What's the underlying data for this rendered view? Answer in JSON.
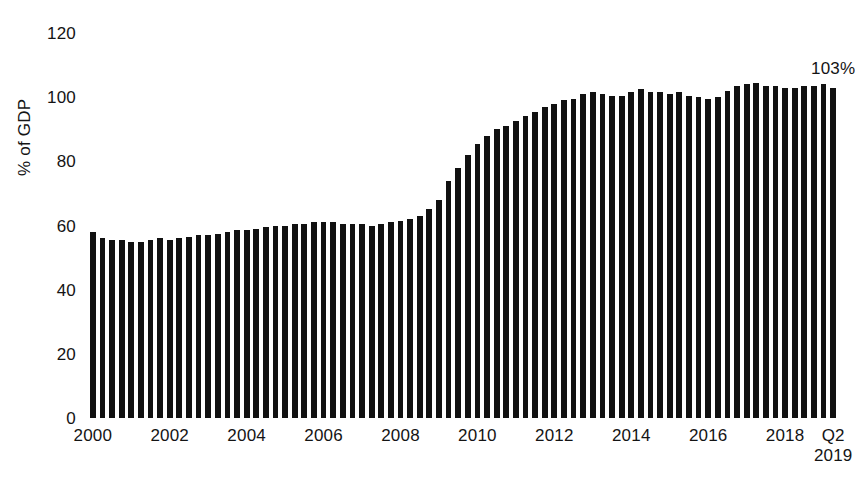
{
  "chart_data": {
    "type": "bar",
    "title": "",
    "xlabel": "",
    "ylabel": "% of GDP",
    "ylim": [
      0,
      120
    ],
    "ytick_values": [
      0,
      20,
      40,
      60,
      80,
      100,
      120
    ],
    "ytick_labels": [
      "0",
      "20",
      "40",
      "60",
      "80",
      "100",
      "120"
    ],
    "grid": false,
    "legend": false,
    "legend_position": "none",
    "bar_color": "#111111",
    "background_color": "#ffffff",
    "frequency": "quarterly",
    "x_start": "2000 Q1",
    "x_end": "2019 Q2",
    "xtick_labels": [
      {
        "label": "2000",
        "label2": "",
        "index": 0
      },
      {
        "label": "2002",
        "label2": "",
        "index": 8
      },
      {
        "label": "2004",
        "label2": "",
        "index": 16
      },
      {
        "label": "2006",
        "label2": "",
        "index": 24
      },
      {
        "label": "2008",
        "label2": "",
        "index": 32
      },
      {
        "label": "2010",
        "label2": "",
        "index": 40
      },
      {
        "label": "2012",
        "label2": "",
        "index": 48
      },
      {
        "label": "2014",
        "label2": "",
        "index": 56
      },
      {
        "label": "2016",
        "label2": "",
        "index": 64
      },
      {
        "label": "2018",
        "label2": "",
        "index": 72
      },
      {
        "label": "Q2",
        "label2": "2019",
        "index": 77
      }
    ],
    "categories": [
      "2000 Q1",
      "2000 Q2",
      "2000 Q3",
      "2000 Q4",
      "2001 Q1",
      "2001 Q2",
      "2001 Q3",
      "2001 Q4",
      "2002 Q1",
      "2002 Q2",
      "2002 Q3",
      "2002 Q4",
      "2003 Q1",
      "2003 Q2",
      "2003 Q3",
      "2003 Q4",
      "2004 Q1",
      "2004 Q2",
      "2004 Q3",
      "2004 Q4",
      "2005 Q1",
      "2005 Q2",
      "2005 Q3",
      "2005 Q4",
      "2006 Q1",
      "2006 Q2",
      "2006 Q3",
      "2006 Q4",
      "2007 Q1",
      "2007 Q2",
      "2007 Q3",
      "2007 Q4",
      "2008 Q1",
      "2008 Q2",
      "2008 Q3",
      "2008 Q4",
      "2009 Q1",
      "2009 Q2",
      "2009 Q3",
      "2009 Q4",
      "2010 Q1",
      "2010 Q2",
      "2010 Q3",
      "2010 Q4",
      "2011 Q1",
      "2011 Q2",
      "2011 Q3",
      "2011 Q4",
      "2012 Q1",
      "2012 Q2",
      "2012 Q3",
      "2012 Q4",
      "2013 Q1",
      "2013 Q2",
      "2013 Q3",
      "2013 Q4",
      "2014 Q1",
      "2014 Q2",
      "2014 Q3",
      "2014 Q4",
      "2015 Q1",
      "2015 Q2",
      "2015 Q3",
      "2015 Q4",
      "2016 Q1",
      "2016 Q2",
      "2016 Q3",
      "2016 Q4",
      "2017 Q1",
      "2017 Q2",
      "2017 Q3",
      "2017 Q4",
      "2018 Q1",
      "2018 Q2",
      "2018 Q3",
      "2018 Q4",
      "2019 Q1",
      "2019 Q2"
    ],
    "values": [
      58,
      56,
      55.5,
      55.5,
      55,
      55,
      55.5,
      56,
      55.5,
      56,
      56.5,
      57,
      57,
      57.5,
      58,
      58.5,
      58.5,
      59,
      59.5,
      60,
      60,
      60.5,
      60.5,
      61,
      61,
      61,
      60.5,
      60.5,
      60.5,
      60,
      60.5,
      61,
      61.5,
      62,
      63,
      65,
      68,
      74,
      78,
      82,
      85.5,
      88,
      90,
      91,
      92.5,
      94,
      95.5,
      97,
      98,
      99,
      99.5,
      101,
      101.5,
      101,
      100.5,
      100.5,
      101.5,
      102.5,
      101.5,
      101.5,
      101,
      101.5,
      100.5,
      100,
      99.5,
      100,
      102,
      103.5,
      104,
      104.5,
      103.5,
      103.5,
      103,
      103,
      103.5,
      103.5,
      104,
      103
    ],
    "annotations": [
      {
        "text": "103%",
        "index": 77,
        "value": 103
      }
    ]
  }
}
